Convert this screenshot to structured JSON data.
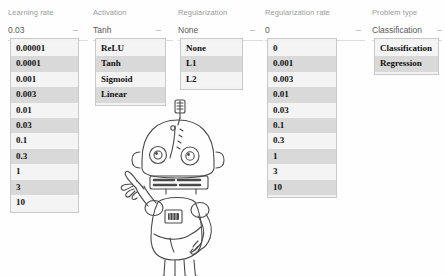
{
  "page": {
    "background_color": "#ffffff"
  },
  "columns": [
    {
      "name": "learning-rate",
      "label": "Learning rate",
      "selected": "0.03",
      "caret_icon": "chevron-down-icon",
      "options": [
        "0.00001",
        "0.0001",
        "0.001",
        "0.003",
        "0.01",
        "0.03",
        "0.1",
        "0.3",
        "1",
        "3",
        "10"
      ]
    },
    {
      "name": "activation",
      "label": "Activation",
      "selected": "Tanh",
      "caret_icon": "chevron-down-icon",
      "options": [
        "ReLU",
        "Tanh",
        "Sigmoid",
        "Linear"
      ]
    },
    {
      "name": "regularization",
      "label": "Regularization",
      "selected": "None",
      "caret_icon": "chevron-down-icon",
      "options": [
        "None",
        "L1",
        "L2"
      ]
    },
    {
      "name": "regularization-rate",
      "label": "Regularization rate",
      "selected": "0",
      "caret_icon": "chevron-down-icon",
      "options": [
        "0",
        "0.001",
        "0.003",
        "0.01",
        "0.03",
        "0.1",
        "0.3",
        "1",
        "3",
        "10"
      ]
    },
    {
      "name": "problem-type",
      "label": "Problem type",
      "selected": "Classification",
      "caret_icon": "chevron-down-icon",
      "options": [
        "Classification",
        "Regression"
      ]
    }
  ],
  "illustration": {
    "name": "robot-line-drawing",
    "description": "Line-art cartoon robot with antenna, pointing one finger up, other hand on hip",
    "stroke_color": "#4a4a4a"
  },
  "colors": {
    "label_text": "#9a9a9a",
    "select_text": "#5a5a5a",
    "option_text": "#111111",
    "option_row_light": "#f4f4f4",
    "option_row_dark": "#d9d9d9",
    "list_border": "#c9c9c9",
    "select_underline": "#dcdcdc"
  }
}
